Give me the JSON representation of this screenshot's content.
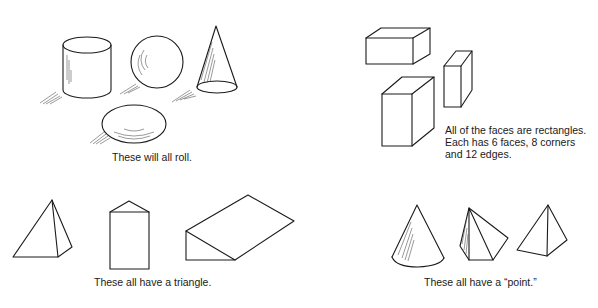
{
  "figure": {
    "panels": [
      {
        "id": "roll",
        "caption": "These will all roll.",
        "shapes": [
          "cylinder",
          "sphere",
          "cone",
          "ellipsoid"
        ]
      },
      {
        "id": "rectangles",
        "caption_lines": [
          "All of the faces are rectangles.",
          "Each has 6 faces, 8 corners",
          "and 12 edges."
        ],
        "shapes": [
          "flat-box",
          "tall-box",
          "thin-box"
        ]
      },
      {
        "id": "triangle",
        "caption": "These all have a triangle.",
        "shapes": [
          "square-pyramid",
          "triangular-prism-upright",
          "wedge"
        ]
      },
      {
        "id": "point",
        "caption": "These all have a “point.”",
        "shapes": [
          "cone",
          "pentagonal-pyramid",
          "square-pyramid"
        ]
      }
    ]
  }
}
